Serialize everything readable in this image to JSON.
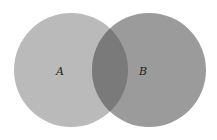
{
  "diagram": {
    "type": "venn",
    "sets": [
      {
        "id": "A",
        "label": "A",
        "cx": 71,
        "cy": 70,
        "r": 57,
        "color": "#bababa"
      },
      {
        "id": "B",
        "label": "B",
        "cx": 149,
        "cy": 70,
        "r": 57,
        "color": "#9b9b9b"
      }
    ],
    "intersection": {
      "color": "#7a7a7a"
    },
    "background": "#ffffff"
  }
}
